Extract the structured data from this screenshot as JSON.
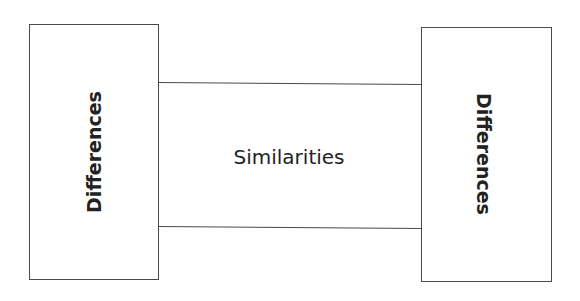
{
  "diagram": {
    "left_box": {
      "label": "Differences"
    },
    "middle": {
      "label": "Similarities"
    },
    "right_box": {
      "label": "Differences"
    }
  }
}
